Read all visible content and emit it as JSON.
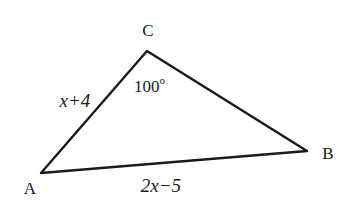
{
  "diagram": {
    "type": "triangle",
    "vertices": [
      {
        "name": "A",
        "label": "A"
      },
      {
        "name": "B",
        "label": "B"
      },
      {
        "name": "C",
        "label": "C"
      }
    ],
    "sides": {
      "AC": {
        "label": "x+4"
      },
      "AB": {
        "label": "2x−5"
      },
      "CB": {
        "label": ""
      }
    },
    "angles": {
      "C": {
        "label": "100",
        "degree_symbol": "o"
      }
    },
    "stroke_color": "#1a1a1a",
    "background": "#ffffff"
  }
}
